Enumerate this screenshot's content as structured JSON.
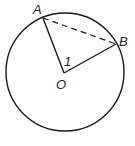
{
  "diagram": {
    "type": "circle-geometry",
    "circle": {
      "center": "O",
      "cx": 65,
      "cy": 72,
      "r": 59
    },
    "points": {
      "A": {
        "label": "A",
        "x": 43,
        "y": 18
      },
      "B": {
        "label": "B",
        "x": 116,
        "y": 44
      },
      "O": {
        "label": "O",
        "x": 64,
        "y": 73
      }
    },
    "segments": [
      {
        "from": "O",
        "to": "A",
        "style": "solid"
      },
      {
        "from": "O",
        "to": "B",
        "style": "solid"
      },
      {
        "from": "A",
        "to": "B",
        "style": "dashed"
      }
    ],
    "angle_label": "1",
    "colors": {
      "stroke": "#1a1a1a",
      "background": "#ffffff"
    }
  }
}
